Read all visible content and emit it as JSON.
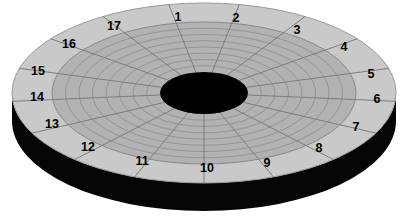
{
  "figure": {
    "kind": "diagram",
    "background_color": "#ffffff"
  },
  "disk": {
    "top_face_color": "#c9c9c9",
    "track_area_color": "#b2b2b2",
    "side_wall_color": "#050505",
    "center_hole_color": "#000000",
    "grid_line_color": "#8a8a8a",
    "sector_divider_color": "#7d7d7d",
    "outline_color": "#9a9a9a",
    "sector_count": 17,
    "track_ring_count": 7,
    "geometry": {
      "center_x": 204,
      "center_y": 93,
      "outer_radius_x": 192,
      "outer_radius_y": 90,
      "band_inner_radius_x": 152,
      "band_inner_radius_y": 71,
      "hub_radius_x": 44,
      "hub_radius_y": 21,
      "side_wall_depth": 28
    }
  },
  "sectors": [
    {
      "id": 1,
      "label": "1",
      "x": 178,
      "y": 17
    },
    {
      "id": 2,
      "label": "2",
      "x": 236,
      "y": 18
    },
    {
      "id": 3,
      "label": "3",
      "x": 297,
      "y": 30
    },
    {
      "id": 4,
      "label": "4",
      "x": 344,
      "y": 47
    },
    {
      "id": 5,
      "label": "5",
      "x": 371,
      "y": 74
    },
    {
      "id": 6,
      "label": "6",
      "x": 377,
      "y": 99
    },
    {
      "id": 7,
      "label": "7",
      "x": 356,
      "y": 127
    },
    {
      "id": 8,
      "label": "8",
      "x": 319,
      "y": 148
    },
    {
      "id": 9,
      "label": "9",
      "x": 267,
      "y": 163
    },
    {
      "id": 10,
      "label": "10",
      "x": 207,
      "y": 168
    },
    {
      "id": 11,
      "label": "11",
      "x": 142,
      "y": 161
    },
    {
      "id": 12,
      "label": "12",
      "x": 88,
      "y": 147
    },
    {
      "id": 13,
      "label": "13",
      "x": 52,
      "y": 124
    },
    {
      "id": 14,
      "label": "14",
      "x": 37,
      "y": 97
    },
    {
      "id": 15,
      "label": "15",
      "x": 38,
      "y": 71
    },
    {
      "id": 16,
      "label": "16",
      "x": 69,
      "y": 44
    },
    {
      "id": 17,
      "label": "17",
      "x": 114,
      "y": 26
    }
  ]
}
